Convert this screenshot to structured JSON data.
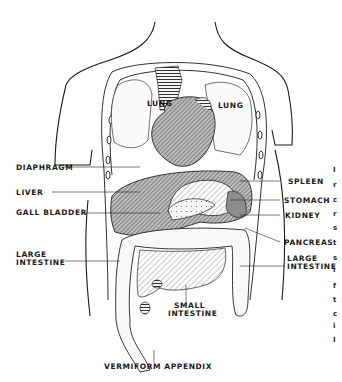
{
  "figure": {
    "colors": {
      "line": "#1a1a1a",
      "fill_dark": "#777777",
      "fill_mid": "#a8a8a8",
      "background": "#ffffff"
    }
  },
  "labels": {
    "lung_left": "LUNG",
    "lung_right": "LUNG",
    "diaphragm": "DIAPHRAGM",
    "liver": "LIVER",
    "gall_bladder": "GALL BLADDER",
    "large_intestine_left_1": "LARGE",
    "large_intestine_left_2": "INTESTINE",
    "spleen": "SPLEEN",
    "stomach": "STOMACH",
    "kidney": "KIDNEY",
    "pancreas": "PANCREAS",
    "large_intestine_right_1": "LARGE",
    "large_intestine_right_2": "INTESTINE",
    "small_intestine_1": "SMALL",
    "small_intestine_2": "INTESTINE",
    "vermiform_appendix": "VERMIFORM APPENDIX"
  },
  "edge_text_fragments": [
    "I",
    "r",
    "c",
    "r",
    "s",
    "t",
    "s",
    "i",
    "f",
    "t",
    "c",
    "i",
    "I"
  ]
}
